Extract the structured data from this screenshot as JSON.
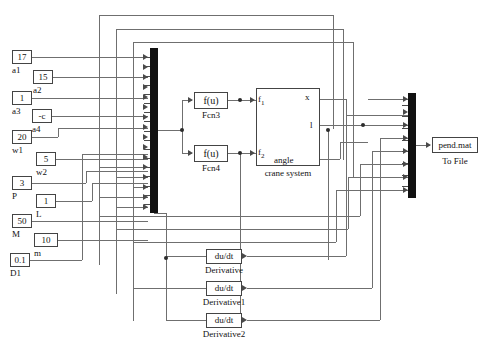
{
  "diagram": {
    "type": "simulink-block-diagram"
  },
  "constants": [
    {
      "name": "a1",
      "value": "17",
      "label": "a1"
    },
    {
      "name": "a2",
      "value": "15",
      "label": "a2"
    },
    {
      "name": "a3",
      "value": "1",
      "label": "a3"
    },
    {
      "name": "a4",
      "value": "-c",
      "label": "a4"
    },
    {
      "name": "w1",
      "value": "20",
      "label": "w1"
    },
    {
      "name": "w2",
      "value": "5",
      "label": "w2"
    },
    {
      "name": "P",
      "value": "3",
      "label": "P"
    },
    {
      "name": "L",
      "value": "1",
      "label": "L"
    },
    {
      "name": "M",
      "value": "50",
      "label": "M"
    },
    {
      "name": "m",
      "value": "10",
      "label": "m"
    },
    {
      "name": "D1",
      "value": "0.1",
      "label": "D1"
    }
  ],
  "functions": [
    {
      "name": "Fcn3",
      "expr": "f(u)",
      "label": "Fcn3"
    },
    {
      "name": "Fcn4",
      "expr": "f(u)",
      "label": "Fcn4"
    }
  ],
  "plant": {
    "label": "crane system",
    "inputs": [
      {
        "name": "f1",
        "label": "f",
        "sub": "1"
      },
      {
        "name": "f2",
        "label": "f",
        "sub": "2"
      }
    ],
    "outputs": [
      {
        "name": "x",
        "label": "x"
      },
      {
        "name": "l",
        "label": "l"
      },
      {
        "name": "angle",
        "label": "angle"
      }
    ]
  },
  "derivatives": [
    {
      "name": "Derivative",
      "expr": "du/dt",
      "label": "Derivative"
    },
    {
      "name": "Derivative1",
      "expr": "du/dt",
      "label": "Derivative1"
    },
    {
      "name": "Derivative2",
      "expr": "du/dt",
      "label": "Derivative2"
    }
  ],
  "sinks": [
    {
      "name": "to-file",
      "value": "pend.mat",
      "label": "To File"
    }
  ],
  "mux": [
    {
      "name": "mux-left",
      "ports": 17
    },
    {
      "name": "mux-right",
      "ports": 8
    }
  ],
  "colors": {
    "wire": "#6f6f6f",
    "block_border": "#444444",
    "mux_fill": "#111111",
    "background": "#ffffff"
  }
}
